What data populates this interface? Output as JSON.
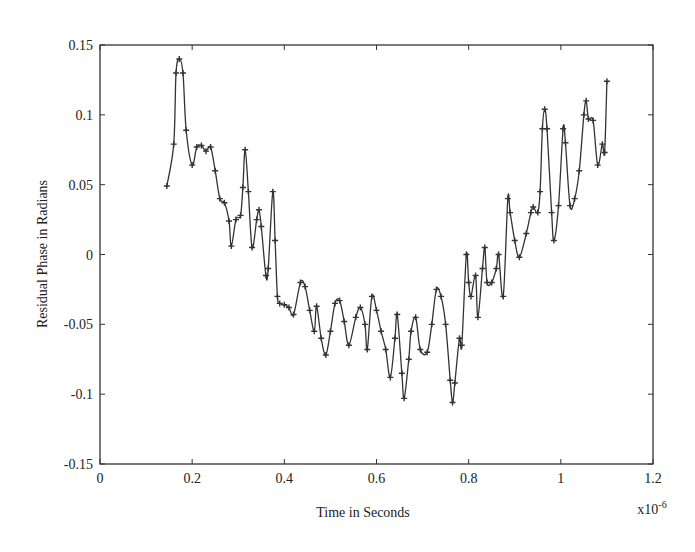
{
  "chart_data": {
    "type": "line",
    "title": "",
    "xlabel": "Time in Seconds",
    "ylabel": "Residual Phase in Radians",
    "x_multiplier_label": "x10-6",
    "xlim": [
      0,
      1.2
    ],
    "ylim": [
      -0.15,
      0.15
    ],
    "xticks": [
      "0",
      "0.2",
      "0.4",
      "0.6",
      "0.8",
      "1",
      "1.2"
    ],
    "yticks": [
      "0.15",
      "0.1",
      "0.05",
      "0",
      "-0.05",
      "-0.1",
      "-0.15"
    ],
    "grid": false,
    "legend": null,
    "marker": "+",
    "line_color": "#333333",
    "series": [
      {
        "name": "Residual Phase",
        "x": [
          0.145,
          0.16,
          0.165,
          0.172,
          0.18,
          0.187,
          0.2,
          0.21,
          0.22,
          0.23,
          0.24,
          0.25,
          0.26,
          0.27,
          0.28,
          0.285,
          0.295,
          0.305,
          0.31,
          0.315,
          0.322,
          0.33,
          0.34,
          0.345,
          0.35,
          0.36,
          0.365,
          0.375,
          0.38,
          0.385,
          0.39,
          0.4,
          0.41,
          0.42,
          0.435,
          0.445,
          0.455,
          0.465,
          0.47,
          0.48,
          0.49,
          0.5,
          0.51,
          0.52,
          0.53,
          0.54,
          0.555,
          0.565,
          0.575,
          0.58,
          0.59,
          0.6,
          0.61,
          0.62,
          0.63,
          0.64,
          0.645,
          0.655,
          0.66,
          0.67,
          0.675,
          0.685,
          0.695,
          0.71,
          0.72,
          0.73,
          0.74,
          0.75,
          0.76,
          0.765,
          0.77,
          0.78,
          0.785,
          0.795,
          0.8,
          0.805,
          0.815,
          0.82,
          0.83,
          0.835,
          0.84,
          0.85,
          0.86,
          0.865,
          0.875,
          0.885,
          0.89,
          0.9,
          0.91,
          0.925,
          0.935,
          0.94,
          0.95,
          0.955,
          0.96,
          0.965,
          0.97,
          0.98,
          0.985,
          0.995,
          1.005,
          1.01,
          1.02,
          1.03,
          1.04,
          1.05,
          1.055,
          1.06,
          1.07,
          1.08,
          1.09,
          1.095,
          1.1
        ],
        "y": [
          0.049,
          0.079,
          0.13,
          0.14,
          0.13,
          0.089,
          0.064,
          0.077,
          0.078,
          0.074,
          0.077,
          0.06,
          0.04,
          0.037,
          0.024,
          0.006,
          0.025,
          0.028,
          0.048,
          0.075,
          0.045,
          0.005,
          0.025,
          0.032,
          0.02,
          -0.015,
          -0.01,
          0.045,
          0.01,
          -0.03,
          -0.035,
          -0.036,
          -0.038,
          -0.043,
          -0.02,
          -0.023,
          -0.04,
          -0.055,
          -0.037,
          -0.06,
          -0.072,
          -0.055,
          -0.035,
          -0.033,
          -0.048,
          -0.065,
          -0.045,
          -0.038,
          -0.05,
          -0.068,
          -0.03,
          -0.04,
          -0.055,
          -0.068,
          -0.088,
          -0.06,
          -0.043,
          -0.085,
          -0.103,
          -0.075,
          -0.055,
          -0.045,
          -0.068,
          -0.07,
          -0.05,
          -0.025,
          -0.03,
          -0.05,
          -0.09,
          -0.106,
          -0.092,
          -0.06,
          -0.065,
          0.0,
          -0.02,
          -0.03,
          -0.015,
          -0.045,
          -0.01,
          0.005,
          -0.02,
          -0.02,
          -0.01,
          0.0,
          -0.03,
          0.04,
          0.03,
          0.01,
          -0.002,
          0.015,
          0.03,
          0.034,
          0.03,
          0.045,
          0.09,
          0.104,
          0.09,
          0.03,
          0.01,
          0.035,
          0.09,
          0.08,
          0.035,
          0.04,
          0.06,
          0.1,
          0.11,
          0.097,
          0.096,
          0.064,
          0.079,
          0.073,
          0.124
        ]
      }
    ]
  }
}
